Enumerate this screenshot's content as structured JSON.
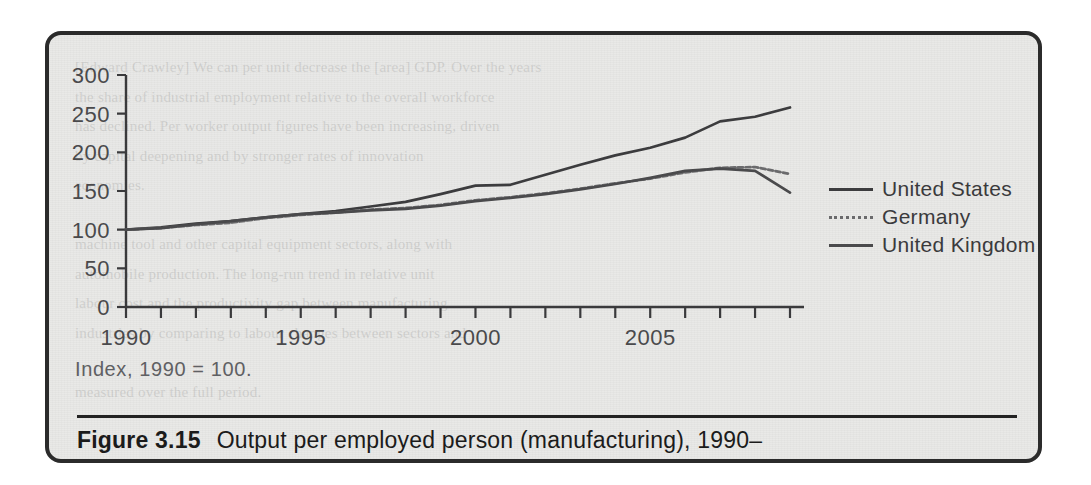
{
  "figure": {
    "label": "Figure 3.15",
    "caption": "Output per employed person (manufacturing), 1990–",
    "note": "Index, 1990 = 100."
  },
  "ghost_text": "[Edward Crawley] We can per unit decrease the [area] GDP. Over the years\nthe share of industrial employment relative to the overall workforce\nhas declined. Per worker output figures have been increasing, driven\nby capital deepening and by stronger rates of innovation\neconomies.\n\nmachine tool and other capital equipment sectors, along with\nautomobile production. The long-run trend in relative unit\nlabour cost and the productivity gap between manufacturing\nindustries by comparing to labour changes between sectors and\n\nmeasured over the full period.",
  "legend": {
    "items": [
      {
        "label": "United States",
        "style": "solid-dark",
        "color": "#3c3c3e"
      },
      {
        "label": "Germany",
        "style": "dotted",
        "color": "#6a6a6c"
      },
      {
        "label": "United Kingdom",
        "style": "solid-mid",
        "color": "#4a4a4c"
      }
    ]
  },
  "chart_data": {
    "type": "line",
    "title": "Output per employed person (manufacturing), 1990–",
    "subtitle": "Index, 1990 = 100.",
    "xlabel": "",
    "ylabel": "",
    "xlim": [
      1990,
      2009
    ],
    "ylim": [
      0,
      300
    ],
    "yticks": [
      0,
      50,
      100,
      150,
      200,
      250,
      300
    ],
    "ytick_labels": [
      "0",
      "50",
      "100",
      "150",
      "200",
      "250",
      "300"
    ],
    "xticks": [
      1990,
      1991,
      1992,
      1993,
      1994,
      1995,
      1996,
      1997,
      1998,
      1999,
      2000,
      2001,
      2002,
      2003,
      2004,
      2005,
      2006,
      2007,
      2008,
      2009
    ],
    "xtick_labels_shown": [
      "1990",
      "1995",
      "2000",
      "2005"
    ],
    "xtick_labels_shown_at": [
      1990,
      1995,
      2000,
      2005
    ],
    "grid": false,
    "legend_position": "right",
    "x": [
      1990,
      1991,
      1992,
      1993,
      1994,
      1995,
      1996,
      1997,
      1998,
      1999,
      2000,
      2001,
      2002,
      2003,
      2004,
      2005,
      2006,
      2007,
      2008,
      2009
    ],
    "series": [
      {
        "name": "United States",
        "color": "#3c3c3e",
        "values": [
          100,
          103,
          108,
          111,
          116,
          120,
          124,
          130,
          136,
          146,
          157,
          158,
          171,
          184,
          196,
          206,
          219,
          240,
          246,
          258
        ]
      },
      {
        "name": "Germany",
        "color": "#6a6a6c",
        "values": [
          100,
          102,
          106,
          109,
          115,
          119,
          122,
          126,
          128,
          132,
          138,
          142,
          147,
          153,
          160,
          166,
          174,
          180,
          181,
          172
        ]
      },
      {
        "name": "United Kingdom",
        "color": "#4a4a4c",
        "values": [
          100,
          102,
          107,
          111,
          116,
          120,
          122,
          125,
          127,
          131,
          137,
          141,
          146,
          152,
          159,
          167,
          176,
          179,
          176,
          148
        ]
      }
    ]
  },
  "axis": {
    "y_labels": [
      "300",
      "250",
      "200",
      "150",
      "100",
      "50",
      "0"
    ],
    "x_labels": [
      "1990",
      "1995",
      "2000",
      "2005"
    ]
  }
}
